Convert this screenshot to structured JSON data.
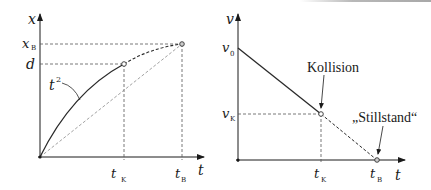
{
  "left_chart": {
    "y_axis_label": "x",
    "x_axis_label": "t",
    "y_ticks": [
      {
        "label": "x",
        "sub": "B",
        "y": 44
      },
      {
        "label": "d",
        "sub": "",
        "y": 64
      }
    ],
    "x_ticks": [
      {
        "label": "t",
        "sub": "K",
        "x": 124
      },
      {
        "label": "t",
        "sub": "B",
        "x": 182
      }
    ],
    "curve_label": "t",
    "curve_label_sup": "2"
  },
  "right_chart": {
    "y_axis_label": "v",
    "x_axis_label": "t",
    "y_ticks": [
      {
        "label": "v",
        "sub": "0",
        "y": 48
      },
      {
        "label": "v",
        "sub": "K",
        "y": 114
      }
    ],
    "x_ticks": [
      {
        "label": "t",
        "sub": "K",
        "x": 321
      },
      {
        "label": "t",
        "sub": "B",
        "x": 377
      }
    ],
    "annotations": {
      "collision": "Kollision",
      "standstill": "„Stillstand“"
    }
  },
  "colors": {
    "line": "#2a2a2a",
    "dashed": "#555555",
    "light_dashed": "#8a8a8a"
  }
}
